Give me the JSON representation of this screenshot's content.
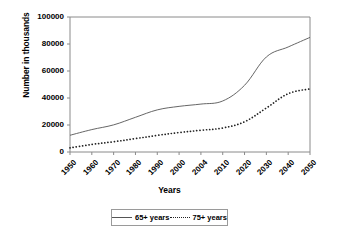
{
  "chart_data": {
    "type": "line",
    "title": "",
    "xlabel": "Years",
    "ylabel": "Number in thousands",
    "categories": [
      "1950",
      "1960",
      "1970",
      "1980",
      "1990",
      "2000",
      "2004",
      "2010",
      "2020",
      "2030",
      "2040",
      "2050"
    ],
    "ylim": [
      0,
      100000
    ],
    "yticks": [
      "0",
      "20000",
      "40000",
      "60000",
      "80000",
      "100000"
    ],
    "ytick_values": [
      0,
      20000,
      40000,
      60000,
      80000,
      100000
    ],
    "grid": false,
    "legend_position": "bottom",
    "series": [
      {
        "name": "65+ years",
        "style": "solid",
        "color": "#555555",
        "values": [
          12400,
          16600,
          20100,
          25700,
          31200,
          33800,
          35500,
          37800,
          49400,
          70400,
          77800,
          84900
        ]
      },
      {
        "name": "75+ years",
        "style": "dotted",
        "color": "#222222",
        "values": [
          3000,
          5600,
          7600,
          9900,
          12300,
          14400,
          16100,
          17800,
          22400,
          32600,
          43200,
          46800
        ]
      }
    ]
  },
  "legend": {
    "items": [
      {
        "label": "65+ years"
      },
      {
        "label": "75+ years"
      }
    ]
  },
  "axis": {
    "x_title": "Years",
    "y_title": "Number in thousands"
  }
}
